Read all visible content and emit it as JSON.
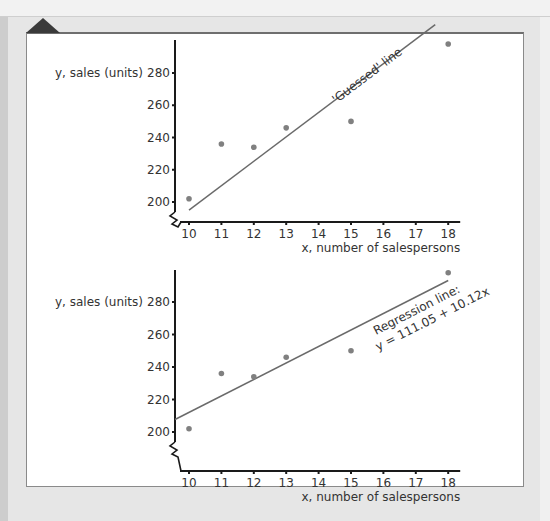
{
  "chart_data": [
    {
      "type": "scatter",
      "title": "",
      "xlabel": "x, number of salespersons",
      "ylabel": "y, sales (units)",
      "x_ticks": [
        "10",
        "11",
        "12",
        "13",
        "14",
        "15",
        "16",
        "17",
        "18"
      ],
      "y_ticks": [
        "200",
        "220",
        "240",
        "260",
        "280"
      ],
      "xlim": [
        10,
        18
      ],
      "ylim": [
        190,
        300
      ],
      "axis_break": "y-axis below 200",
      "grid": false,
      "points": [
        {
          "x": 10,
          "y": 202
        },
        {
          "x": 11,
          "y": 236
        },
        {
          "x": 12,
          "y": 234
        },
        {
          "x": 13,
          "y": 246
        },
        {
          "x": 15,
          "y": 250
        },
        {
          "x": 18,
          "y": 298
        }
      ],
      "line": {
        "name": "'Guessed' line",
        "x": [
          10,
          17.6
        ],
        "y": [
          195,
          310
        ]
      },
      "annotations": [
        "'Guessed' line"
      ]
    },
    {
      "type": "scatter",
      "title": "",
      "xlabel": "x, number of salespersons",
      "ylabel": "y, sales (units)",
      "x_ticks": [
        "10",
        "11",
        "12",
        "13",
        "14",
        "15",
        "16",
        "17",
        "18"
      ],
      "y_ticks": [
        "200",
        "220",
        "240",
        "260",
        "280"
      ],
      "xlim": [
        10,
        18
      ],
      "ylim": [
        190,
        300
      ],
      "axis_break": "y-axis below 200",
      "grid": false,
      "points": [
        {
          "x": 10,
          "y": 202
        },
        {
          "x": 11,
          "y": 236
        },
        {
          "x": 12,
          "y": 234
        },
        {
          "x": 13,
          "y": 246
        },
        {
          "x": 15,
          "y": 250
        },
        {
          "x": 18,
          "y": 298
        }
      ],
      "line": {
        "name": "Regression line",
        "intercept": 111.05,
        "slope": 10.12,
        "x": [
          9.55,
          18
        ]
      },
      "annotations": [
        "Regression line:",
        "y = 111.05 + 10.12x"
      ]
    }
  ],
  "colors": {
    "axis": "#1a1a1a",
    "point": "#808080",
    "line": "#6a6a6a",
    "text": "#333333"
  }
}
